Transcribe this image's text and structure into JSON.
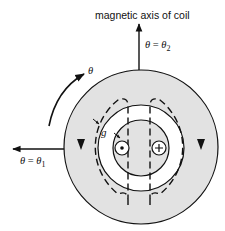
{
  "title": "magnetic axis of coil",
  "labels": {
    "theta_axis_top": {
      "lhs": "θ",
      "eq": " = ",
      "rhs": "θ",
      "sub": "2"
    },
    "theta_axis_left": {
      "lhs": "θ",
      "eq": " = ",
      "rhs": "θ",
      "sub": "1"
    },
    "theta_direction": "θ",
    "gap": "g"
  },
  "conductors": [
    {
      "name": "dot",
      "symbol": "•",
      "meaning": "current out of page"
    },
    {
      "name": "cross",
      "symbol": "+",
      "meaning": "current into page"
    }
  ],
  "colors": {
    "iron_fill": "#e2e2e2",
    "air_fill": "#ffffff",
    "stroke": "#111111"
  }
}
